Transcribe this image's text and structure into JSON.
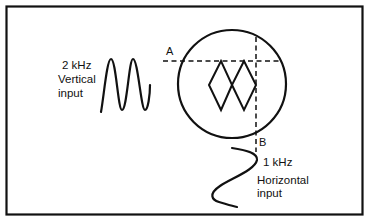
{
  "diagram": {
    "colors": {
      "ink": "#111111",
      "background": "#ffffff"
    },
    "vertical_input": {
      "frequency": "2 kHz",
      "label_line1": "Vertical",
      "label_line2": "input",
      "waveform": "sine, 2 cycles, vertical orientation"
    },
    "horizontal_input": {
      "frequency": "1 kHz",
      "label_line1": "Horizontal",
      "label_line2": "input",
      "waveform": "sine, 1 cycle, drawn running downward"
    },
    "screen": {
      "shape": "circle",
      "pattern": "figure-eight (two loops side by side)",
      "marker_a": "A",
      "marker_b": "B",
      "marker_a_desc": "horizontal dashed tangent line at top of pattern",
      "marker_b_desc": "vertical dashed tangent line at right of pattern"
    }
  }
}
